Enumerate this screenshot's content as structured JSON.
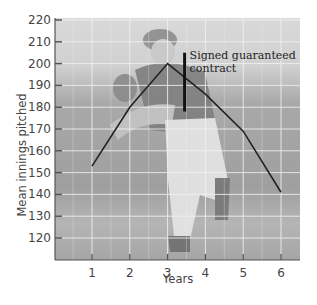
{
  "chart_data": {
    "type": "line",
    "title": "",
    "xlabel": "Years",
    "ylabel": "Mean innings pitched",
    "x": [
      1,
      2,
      3,
      4,
      5,
      6
    ],
    "series": [
      {
        "name": "Mean innings pitched",
        "values": [
          153,
          180,
          200,
          186,
          169,
          141
        ]
      }
    ],
    "xticks": [
      "1",
      "2",
      "3",
      "4",
      "5",
      "6"
    ],
    "yticks": [
      120,
      130,
      140,
      150,
      160,
      170,
      180,
      190,
      200,
      210,
      220
    ],
    "ylim": [
      110,
      220
    ],
    "xlim": [
      0,
      6.5
    ],
    "grid": true,
    "legend": null,
    "annotations": [
      {
        "text_line1": "Signed guaranteed",
        "text_line2": "contract",
        "x": 3.45,
        "y_from": 178,
        "y_to": 205
      }
    ],
    "line_color": "#222222",
    "background": "photo of baseball pitcher (greyscale)"
  }
}
